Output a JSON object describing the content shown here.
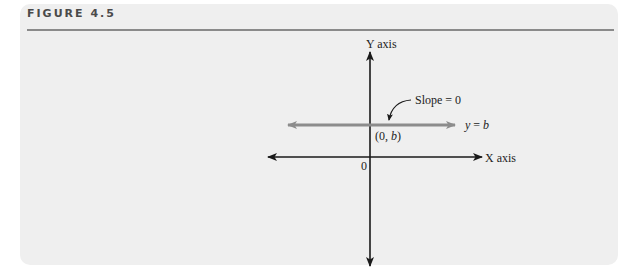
{
  "figure": {
    "title": "FIGURE 4.5"
  },
  "diagram": {
    "y_axis_label": "Y axis",
    "x_axis_label": "X axis",
    "origin_label": "0",
    "line_label_y": "y",
    "line_label_eq": " = ",
    "line_label_b": "b",
    "intercept_label_open": "(0, ",
    "intercept_label_b": "b",
    "intercept_label_close": ")",
    "slope_label": "Slope = 0",
    "colors": {
      "axes": "#1a1a1a",
      "horizontal_line": "#8c8c8c",
      "background": "#efefef"
    }
  }
}
